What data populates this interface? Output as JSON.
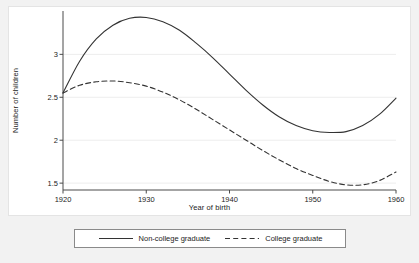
{
  "figure": {
    "background_color": "#f2f2f2",
    "plot_background_color": "#ffffff"
  },
  "chart_data": {
    "type": "line",
    "title": "",
    "xlabel": "Year of birth",
    "ylabel": "Number of children",
    "xlim": [
      1920,
      1960
    ],
    "ylim": [
      1.42,
      3.47
    ],
    "xticks": [
      1920,
      1930,
      1940,
      1950,
      1960
    ],
    "xtick_labels": [
      "1920",
      "1930",
      "1940",
      "1950",
      "1960"
    ],
    "yticks": [
      1.5,
      2,
      2.5,
      3
    ],
    "ytick_labels": [
      "1.5",
      "2",
      "2.5",
      "3"
    ],
    "grid": true,
    "grid_axis": "y",
    "grid_color": "#ededed",
    "legend_position": "below-center",
    "x": [
      1920,
      1922,
      1924,
      1926,
      1928,
      1930,
      1932,
      1934,
      1936,
      1938,
      1940,
      1942,
      1944,
      1946,
      1948,
      1950,
      1952,
      1954,
      1956,
      1958,
      1960
    ],
    "series": [
      {
        "name": "Non-college graduate",
        "style": "solid",
        "color": "#333333",
        "values": [
          2.55,
          2.92,
          3.18,
          3.34,
          3.42,
          3.43,
          3.38,
          3.28,
          3.13,
          2.96,
          2.77,
          2.58,
          2.41,
          2.27,
          2.17,
          2.11,
          2.09,
          2.1,
          2.17,
          2.3,
          2.49
        ]
      },
      {
        "name": "College graduate",
        "style": "dashed",
        "color": "#333333",
        "values": [
          2.55,
          2.64,
          2.68,
          2.69,
          2.67,
          2.63,
          2.56,
          2.47,
          2.36,
          2.24,
          2.12,
          2.0,
          1.88,
          1.77,
          1.67,
          1.59,
          1.52,
          1.48,
          1.48,
          1.53,
          1.63
        ]
      }
    ],
    "annotations": []
  },
  "legend": {
    "entries": [
      {
        "label": "Non-college graduate",
        "style": "solid"
      },
      {
        "label": "College graduate",
        "style": "dashed"
      }
    ]
  }
}
